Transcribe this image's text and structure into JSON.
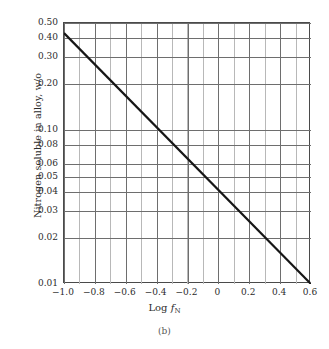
{
  "figure": {
    "caption": "(b)",
    "x_axis_title_prefix": "Log ",
    "x_axis_title_var": "f",
    "x_axis_title_sub": "N",
    "y_axis_title": "Nitrogen soluble in alloy, w/o"
  },
  "colors": {
    "line": "#161616",
    "frame": "#4a4a4a",
    "major_grid": "#6e6e6e",
    "minor_grid": "#b8b8b8",
    "text": "#2b2b2b",
    "caption": "#555555",
    "background": "#ffffff"
  },
  "chart_data": {
    "type": "line",
    "title": "",
    "subtitle": "(b)",
    "xlabel": "Log f_N",
    "ylabel": "Nitrogen soluble in alloy, w/o",
    "xscale": "linear",
    "yscale": "log",
    "xlim": [
      -1.0,
      0.6
    ],
    "ylim": [
      0.01,
      0.5
    ],
    "grid": true,
    "legend": "none",
    "x_ticks": [
      -1.0,
      -0.8,
      -0.6,
      -0.4,
      -0.2,
      0,
      0.2,
      0.4,
      0.6
    ],
    "x_tick_labels": [
      "−1.0",
      "−0.8",
      "−0.6",
      "−0.4",
      "−0.2",
      "0",
      "0.2",
      "0.4",
      "0.6"
    ],
    "x_minor_step": 0.1,
    "y_ticks": [
      0.5,
      0.4,
      0.3,
      0.2,
      0.1,
      0.08,
      0.06,
      0.05,
      0.04,
      0.03,
      0.02,
      0.01
    ],
    "y_tick_labels": [
      "0.50",
      "0.40",
      "0.30",
      "0.20",
      "0.10",
      "0.08",
      "0.06",
      "0.05",
      "0.04",
      "0.03",
      "0.02",
      "0.01"
    ],
    "series": [
      {
        "name": "Nitrogen solubility",
        "x": [
          -1.0,
          -0.8,
          -0.6,
          -0.4,
          -0.2,
          0.0,
          0.2,
          0.4,
          0.6
        ],
        "y": [
          0.43,
          0.327,
          0.249,
          0.19,
          0.144,
          0.11,
          0.0833,
          0.0634,
          0.01
        ],
        "endpoints": [
          {
            "x": -1.0,
            "y": 0.43
          },
          {
            "x": 0.6,
            "y": 0.01
          }
        ],
        "slope_log10_per_unit_x": -1.0,
        "style": "solid",
        "width_px": 2.2
      }
    ]
  }
}
